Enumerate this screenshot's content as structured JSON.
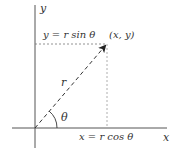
{
  "diagram": {
    "axes": {
      "x_label": "x",
      "y_label": "y"
    },
    "point_label": "(x, y)",
    "radius_label": "r",
    "angle_label": "θ",
    "y_projection_label": "y = r sin θ",
    "x_projection_label": "x = r cos θ",
    "colors": {
      "axis": "#555555",
      "dashed": "#777777",
      "vector": "#333333",
      "text": "#333333"
    }
  }
}
